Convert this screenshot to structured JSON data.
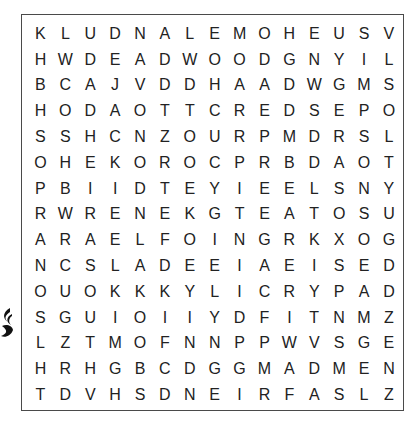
{
  "puzzle": {
    "rows": 15,
    "cols": 15,
    "grid": [
      [
        "K",
        "L",
        "U",
        "D",
        "N",
        "A",
        "L",
        "E",
        "M",
        "O",
        "H",
        "E",
        "U",
        "S",
        "V"
      ],
      [
        "H",
        "W",
        "D",
        "E",
        "A",
        "D",
        "W",
        "O",
        "O",
        "D",
        "G",
        "N",
        "Y",
        "I",
        "L"
      ],
      [
        "B",
        "C",
        "A",
        "J",
        "V",
        "D",
        "D",
        "H",
        "A",
        "A",
        "D",
        "W",
        "G",
        "M",
        "S"
      ],
      [
        "H",
        "O",
        "D",
        "A",
        "O",
        "T",
        "T",
        "C",
        "R",
        "E",
        "D",
        "S",
        "E",
        "P",
        "O"
      ],
      [
        "S",
        "S",
        "H",
        "C",
        "N",
        "Z",
        "O",
        "U",
        "R",
        "P",
        "M",
        "D",
        "R",
        "S",
        "L"
      ],
      [
        "O",
        "H",
        "E",
        "K",
        "O",
        "R",
        "O",
        "C",
        "P",
        "R",
        "B",
        "D",
        "A",
        "O",
        "T"
      ],
      [
        "P",
        "B",
        "I",
        "I",
        "D",
        "T",
        "E",
        "Y",
        "I",
        "E",
        "E",
        "L",
        "S",
        "N",
        "Y"
      ],
      [
        "R",
        "W",
        "R",
        "E",
        "N",
        "E",
        "K",
        "G",
        "T",
        "E",
        "A",
        "T",
        "O",
        "S",
        "U"
      ],
      [
        "A",
        "R",
        "A",
        "E",
        "L",
        "F",
        "O",
        "I",
        "N",
        "G",
        "R",
        "K",
        "X",
        "O",
        "G"
      ],
      [
        "N",
        "C",
        "S",
        "L",
        "A",
        "D",
        "E",
        "E",
        "I",
        "A",
        "E",
        "I",
        "S",
        "E",
        "D"
      ],
      [
        "O",
        "U",
        "O",
        "K",
        "K",
        "K",
        "Y",
        "L",
        "I",
        "C",
        "R",
        "Y",
        "P",
        "A",
        "D"
      ],
      [
        "S",
        "G",
        "U",
        "I",
        "O",
        "I",
        "I",
        "Y",
        "D",
        "F",
        "I",
        "T",
        "N",
        "M",
        "Z"
      ],
      [
        "L",
        "Z",
        "T",
        "M",
        "O",
        "F",
        "N",
        "N",
        "P",
        "P",
        "W",
        "V",
        "S",
        "G",
        "E"
      ],
      [
        "H",
        "R",
        "H",
        "G",
        "B",
        "C",
        "D",
        "G",
        "G",
        "M",
        "A",
        "D",
        "M",
        "E",
        "N"
      ],
      [
        "T",
        "D",
        "V",
        "H",
        "S",
        "D",
        "N",
        "E",
        "I",
        "R",
        "F",
        "A",
        "S",
        "L",
        "Z"
      ]
    ],
    "border_color": "#4a4a4a",
    "letter_color": "#222222"
  },
  "ornament": {
    "icon": "decorative-flourish-icon"
  }
}
